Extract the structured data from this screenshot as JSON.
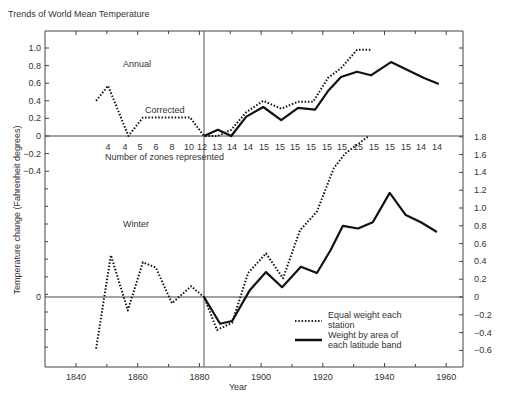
{
  "chart_data": {
    "type": "line",
    "title": "Trends of World Mean Temperature",
    "xlabel": "Year",
    "ylabel": "Temperature change (Fahrenheit degrees)",
    "xlim": [
      1830,
      1970
    ],
    "x_ticks": [
      1840,
      1860,
      1880,
      1900,
      1920,
      1940,
      1960
    ],
    "grid": false,
    "reference_line_year": 1881.5,
    "panels": [
      {
        "name": "Annual",
        "label_annotation": "Corrected",
        "y_axis_side": "left",
        "y_ticks": [
          "1.0",
          "0.8",
          "0.6",
          "0.4",
          "0.2",
          "0",
          "-0.2",
          "-0.4"
        ],
        "series": [
          {
            "name": "Equal weight each station",
            "style": "dotted",
            "points": [
              [
                1846.5,
                0.4
              ],
              [
                1850.4,
                0.57
              ],
              [
                1857.0,
                0.0
              ],
              [
                1861.7,
                0.21
              ],
              [
                1877.0,
                0.21
              ],
              [
                1881.5,
                0.0
              ],
              [
                1886.0,
                0.0
              ],
              [
                1890.3,
                0.07
              ],
              [
                1895.2,
                0.27
              ],
              [
                1900.7,
                0.4
              ],
              [
                1906.5,
                0.31
              ],
              [
                1912.0,
                0.39
              ],
              [
                1916.9,
                0.39
              ],
              [
                1921.7,
                0.66
              ],
              [
                1925.9,
                0.77
              ],
              [
                1931.1,
                0.98
              ],
              [
                1935.6,
                0.98
              ]
            ]
          },
          {
            "name": "Weight by area of each latitude band",
            "style": "solid",
            "points": [
              [
                1881.5,
                0.0
              ],
              [
                1886.0,
                0.07
              ],
              [
                1890.3,
                0.0
              ],
              [
                1895.2,
                0.22
              ],
              [
                1900.7,
                0.33
              ],
              [
                1906.5,
                0.18
              ],
              [
                1912.0,
                0.32
              ],
              [
                1917.5,
                0.3
              ],
              [
                1921.7,
                0.51
              ],
              [
                1925.9,
                0.67
              ],
              [
                1931.1,
                0.73
              ],
              [
                1935.6,
                0.69
              ],
              [
                1942.1,
                0.84
              ],
              [
                1952.8,
                0.66
              ],
              [
                1957.6,
                0.59
              ]
            ]
          }
        ]
      },
      {
        "name": "Winter",
        "y_axis_side": "right",
        "y_ticks": [
          "1.8",
          "1.6",
          "1.4",
          "1.2",
          "1.0",
          "0.8",
          "0.6",
          "0.4",
          "0.2",
          "0",
          "-0.2",
          "-0.4",
          "-0.6"
        ],
        "series": [
          {
            "name": "Equal weight each station",
            "style": "dotted",
            "points": [
              [
                1846.5,
                -0.58
              ],
              [
                1851.3,
                0.47
              ],
              [
                1856.8,
                -0.15
              ],
              [
                1861.7,
                0.39
              ],
              [
                1865.9,
                0.33
              ],
              [
                1871.1,
                -0.07
              ],
              [
                1877.3,
                0.12
              ],
              [
                1881.5,
                0.0
              ],
              [
                1885.7,
                -0.37
              ],
              [
                1890.6,
                -0.29
              ],
              [
                1895.8,
                0.27
              ],
              [
                1901.6,
                0.49
              ],
              [
                1907.1,
                0.21
              ],
              [
                1912.6,
                0.75
              ],
              [
                1918.1,
                0.96
              ],
              [
                1923.6,
                1.45
              ],
              [
                1927.2,
                1.61
              ],
              [
                1934.6,
                1.8
              ]
            ]
          },
          {
            "name": "Weight by area of each latitude band",
            "style": "solid",
            "points": [
              [
                1881.5,
                0.0
              ],
              [
                1886.7,
                -0.3
              ],
              [
                1890.6,
                -0.27
              ],
              [
                1896.4,
                0.08
              ],
              [
                1901.6,
                0.28
              ],
              [
                1906.8,
                0.11
              ],
              [
                1912.9,
                0.34
              ],
              [
                1918.1,
                0.27
              ],
              [
                1922.6,
                0.53
              ],
              [
                1926.5,
                0.8
              ],
              [
                1931.4,
                0.77
              ],
              [
                1936.2,
                0.84
              ],
              [
                1941.7,
                1.17
              ],
              [
                1946.9,
                0.92
              ],
              [
                1951.8,
                0.84
              ],
              [
                1957.0,
                0.73
              ]
            ]
          }
        ]
      }
    ],
    "zones_row_label": "Number of zones represented",
    "zones_counts": [
      "4",
      "4",
      "5",
      "6",
      "8",
      "10",
      "12",
      "13",
      "14",
      "14",
      "15",
      "15",
      "15",
      "15",
      "15",
      "15",
      "15",
      "15",
      "15",
      "15",
      "14",
      "14"
    ],
    "legend": {
      "position": "lower-right",
      "entries": [
        {
          "style": "dotted",
          "label_line1": "Equal weight each",
          "label_line2": "station"
        },
        {
          "style": "solid",
          "label_line1": "Weight by area of",
          "label_line2": "each latitude band"
        }
      ]
    }
  }
}
